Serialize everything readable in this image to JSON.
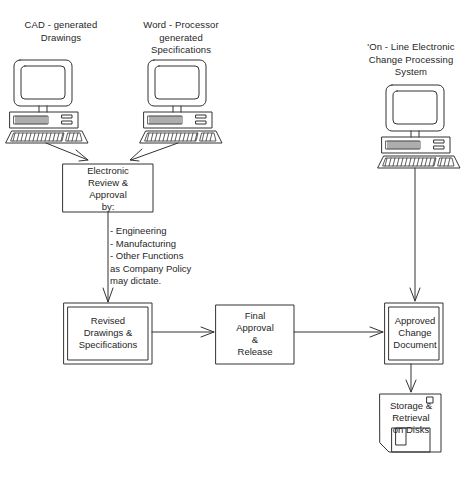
{
  "diagram": {
    "colors": {
      "background": "#ffffff",
      "stroke": "#333333",
      "text": "#262626"
    },
    "sources": {
      "cad": {
        "label": "CAD - generated\nDrawings",
        "icon": "desktop-computer-icon"
      },
      "word_processor": {
        "label": "Word - Processor\ngenerated\nSpecifications",
        "icon": "desktop-computer-icon"
      },
      "online_system": {
        "label": "'On - Line Electronic\nChange Processing\nSystem",
        "icon": "desktop-computer-icon"
      }
    },
    "nodes": {
      "electronic_review": {
        "label": "Electronic\nReview &\nApproval\nby:",
        "shape": "rectangle"
      },
      "criteria": {
        "label": "- Engineering\n- Manufacturing\n- Other Functions\n  as Company Policy\n  may dictate.",
        "shape": "text"
      },
      "revised_drawings": {
        "label": "Revised\nDrawings &\nSpecifications",
        "shape": "double-rectangle"
      },
      "final_approval": {
        "label": "Final\nApproval\n&\nRelease",
        "shape": "rectangle"
      },
      "approved_change_document": {
        "label": "Approved\nChange\nDocument",
        "shape": "double-rectangle"
      },
      "storage_retrieval": {
        "label": "Storage &\nRetrieval\non Disks",
        "shape": "floppy-disk"
      }
    },
    "edges": [
      {
        "from": "cad",
        "to": "electronic_review",
        "arrow": "open"
      },
      {
        "from": "word_processor",
        "to": "electronic_review",
        "arrow": "open"
      },
      {
        "from": "electronic_review",
        "to": "revised_drawings",
        "arrow": "open"
      },
      {
        "from": "revised_drawings",
        "to": "final_approval",
        "arrow": "open"
      },
      {
        "from": "final_approval",
        "to": "approved_change_document",
        "arrow": "open"
      },
      {
        "from": "online_system",
        "to": "approved_change_document",
        "arrow": "open"
      },
      {
        "from": "approved_change_document",
        "to": "storage_retrieval",
        "arrow": "open"
      }
    ]
  }
}
